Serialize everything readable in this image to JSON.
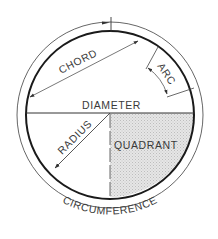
{
  "diagram": {
    "type": "circle-parts",
    "labels": {
      "chord": "CHORD",
      "arc": "ARC",
      "diameter": "DIAMETER",
      "radius": "RADIUS",
      "quadrant": "QUADRANT",
      "circumference": "CIRCUMFERENCE"
    },
    "colors": {
      "stroke": "#1a1a1a",
      "thin_stroke": "#555555",
      "text": "#3a3a3a",
      "quadrant_fill": "#e2e2e2",
      "background": "#ffffff"
    }
  }
}
